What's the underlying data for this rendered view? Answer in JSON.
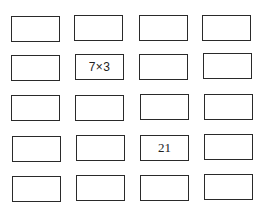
{
  "grid": {
    "rows": 5,
    "columns": 4,
    "cells": [
      [
        "",
        "",
        "",
        ""
      ],
      [
        "",
        "7×3",
        "",
        ""
      ],
      [
        "",
        "",
        "",
        ""
      ],
      [
        "",
        "",
        "21",
        ""
      ],
      [
        "",
        "",
        "",
        ""
      ]
    ]
  },
  "labels": {
    "expression": "7×3",
    "result": "21"
  },
  "colors": {
    "border": "#2a2a2a",
    "text": "#222222",
    "background": "#ffffff"
  }
}
